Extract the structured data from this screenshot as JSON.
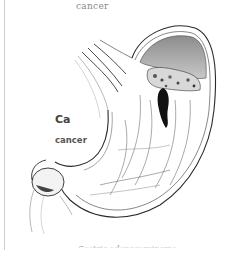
{
  "figure": {
    "labels": {
      "top": "cancer",
      "abbreviation": "Ca",
      "side": "cancer",
      "caption_truncated": "Gastric adenocarcinoma"
    },
    "colors": {
      "ink": "#2a2a2a",
      "shade": "#9a9a9a",
      "tumor": "#111111",
      "border": "#cfcfcf"
    }
  }
}
